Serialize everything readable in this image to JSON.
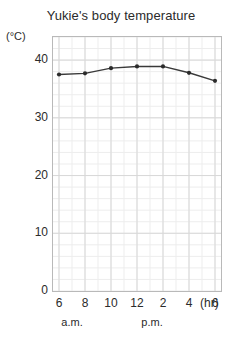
{
  "chart_data": {
    "type": "line",
    "title": "Yukie's body temperature",
    "xlabel": "(hr)",
    "ylabel": "(°C)",
    "ylim": [
      0,
      44
    ],
    "yticks": [
      0,
      10,
      20,
      30,
      40
    ],
    "ytick_labels": [
      "0",
      "10",
      "20",
      "30",
      "40"
    ],
    "xtick_labels": [
      "6",
      "8",
      "10",
      "12",
      "2",
      "4",
      "6"
    ],
    "x": [
      6,
      8,
      10,
      12,
      14,
      16,
      18
    ],
    "values": [
      37.5,
      37.7,
      38.6,
      38.9,
      38.9,
      37.8,
      36.4
    ],
    "period_labels": [
      "a.m.",
      "p.m."
    ],
    "grid": true,
    "legend": "none",
    "line_color": "#3a3a3a",
    "marker_color": "#2b2b2b",
    "grid_color": "#d8d8d8",
    "minor_grid_color": "#ededed",
    "frame_color": "#b9b9b9"
  }
}
